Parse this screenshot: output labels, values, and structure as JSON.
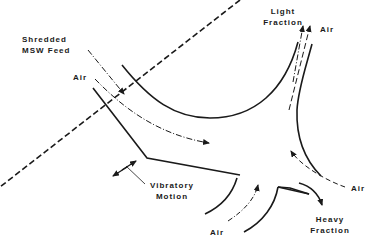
{
  "diagram": {
    "labels": {
      "feed_line1": "Shredded",
      "feed_line2": "MSW Feed",
      "air_left": "Air",
      "light_line1": "Light",
      "light_line2": "Fraction",
      "air_top_right": "Air",
      "vibratory_line1": "Vibratory",
      "vibratory_line2": "Motion",
      "air_bottom": "Air",
      "air_right": "Air",
      "heavy_line1": "Heavy",
      "heavy_line2": "Fraction"
    },
    "colors": {
      "line": "#1a1a1a",
      "background": "#ffffff"
    }
  }
}
